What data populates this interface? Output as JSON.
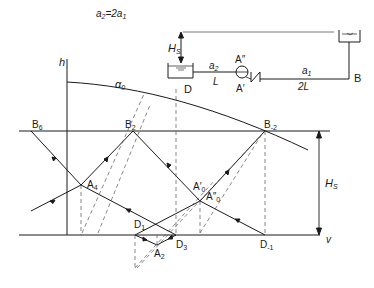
{
  "formula": {
    "lhs": "a",
    "lhs_sub": "2",
    "eq": "=2a",
    "rhs_sub": "1"
  },
  "schematic": {
    "head_label": "H",
    "head_sub": "S",
    "upper_reservoir": "upper-reservoir",
    "lower_reservoir_label": "D",
    "pipe_left_speed": "a",
    "pipe_left_speed_sub": "2",
    "pipe_left_length": "L",
    "pipe_right_speed": "a",
    "pipe_right_speed_sub": "1",
    "pipe_right_length": "2L",
    "pump_top_label": "A″",
    "valve_bottom_label": "A′",
    "end_label": "B"
  },
  "plot": {
    "y_axis_label": "h",
    "x_axis_label": "v",
    "curve_label": "α",
    "curve_label_sub": "0",
    "head_label": "H",
    "head_sub": "S",
    "points": {
      "B6": {
        "base": "B",
        "sub": "6"
      },
      "B2": {
        "base": "B",
        "sub": "2"
      },
      "Bm2": {
        "base": "B",
        "sub": "-2"
      },
      "A4": {
        "base": "A",
        "sub": "4"
      },
      "A0p": {
        "base": "A′",
        "sub": "0"
      },
      "A0pp": {
        "base": "A″",
        "sub": "0"
      },
      "D1": {
        "base": "D",
        "sub": "1"
      },
      "D3": {
        "base": "D",
        "sub": "3"
      },
      "Dm1": {
        "base": "D",
        "sub": "-1"
      },
      "A2": {
        "base": "A",
        "sub": "2"
      }
    }
  }
}
